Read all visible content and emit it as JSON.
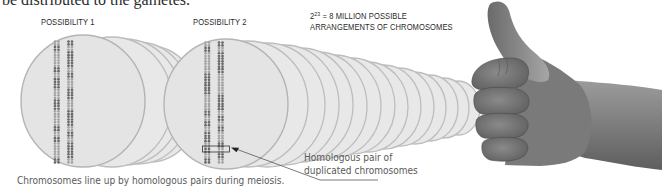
{
  "figure": {
    "partial_top_text": "be distributed to the gametes.",
    "labels": {
      "possibility_1": "POSSIBILITY 1",
      "possibility_2": "POSSIBILITY 2",
      "arrangements_line1_base": "2",
      "arrangements_line1_exponent": "23",
      "arrangements_line1_rest": " = 8 MILLION POSSIBLE",
      "arrangements_line2": "ARRANGEMENTS OF CHROMOSOMES"
    },
    "callout": {
      "line1": "Homologous pair of",
      "line2": "duplicated chromosomes"
    },
    "caption": "Chromosomes line up by homologous pairs during meiosis.",
    "colors": {
      "disk_fill": "#e6e6e6",
      "disk_stroke": "#b9b9b9",
      "chromosome_dark": "#6a6a6a",
      "chromosome_light": "#a4a4a4",
      "text": "#2a2a2a",
      "caption_text": "#5a5a5a",
      "skin_dark": "#6e6e6e",
      "skin_light": "#9a9a9a"
    },
    "illustration": {
      "metaphase_plates": 2,
      "chromosome_rows_per_plate": 23,
      "gesture": "thumbs-up hand"
    }
  }
}
